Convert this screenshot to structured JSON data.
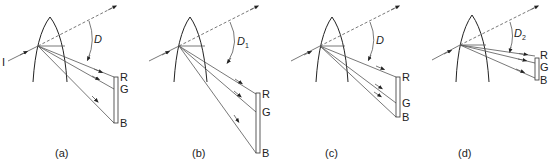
{
  "figure": {
    "panels": [
      {
        "id": "a",
        "caption": "(a)",
        "angle_label": "D",
        "angle_sub": "",
        "incident_label": "I",
        "screen_labels": {
          "r": "R",
          "g": "G",
          "b": "B"
        }
      },
      {
        "id": "b",
        "caption": "(b)",
        "angle_label": "D",
        "angle_sub": "1",
        "incident_label": "",
        "screen_labels": {
          "r": "R",
          "g": "G",
          "b": "B"
        }
      },
      {
        "id": "c",
        "caption": "(c)",
        "angle_label": "D",
        "angle_sub": "",
        "incident_label": "",
        "screen_labels": {
          "r": "R",
          "g": "G",
          "b": "B"
        }
      },
      {
        "id": "d",
        "caption": "(d)",
        "angle_label": "D",
        "angle_sub": "2",
        "incident_label": "",
        "screen_labels": {
          "r": "R",
          "g": "G",
          "b": "B"
        }
      }
    ]
  }
}
